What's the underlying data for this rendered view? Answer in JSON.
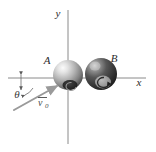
{
  "figure": {
    "kind": "physics-collision-diagram",
    "background_color": "#ffffff",
    "width": 156,
    "height": 152
  },
  "axes": {
    "x_label": "x",
    "y_label": "y",
    "axis_color": "#8a8a8a",
    "origin": {
      "x": 68,
      "y": 78
    },
    "x_axis": {
      "x1": 8,
      "y1": 78,
      "x2": 146,
      "y2": 78
    },
    "y_axis": {
      "x1": 68,
      "y1": 10,
      "x2": 68,
      "y2": 144
    },
    "x_label_pos": {
      "x": 139,
      "y": 86
    },
    "y_label_pos": {
      "x": 58,
      "y": 17
    }
  },
  "bodies": [
    {
      "label": "A",
      "name": "sphere-a",
      "cx": 68,
      "cy": 75,
      "r": 15,
      "shade": "light-gray",
      "base_color": "#b9b9b9",
      "highlight_color": "#f2f2f2",
      "shadow_color": "#4e4e4e",
      "label_pos": {
        "x": 47,
        "y": 64
      }
    },
    {
      "label": "B",
      "name": "sphere-b",
      "cx": 101,
      "cy": 74,
      "r": 16,
      "shade": "dark-gray",
      "base_color": "#5a5a5a",
      "highlight_color": "#d6d6d6",
      "shadow_color": "#242424",
      "label_pos": {
        "x": 114,
        "y": 62
      }
    }
  ],
  "vector": {
    "symbol": "v",
    "subscript": "0",
    "has_overbar": true,
    "name": "initial-velocity-vector",
    "color": "#9a9a9a",
    "tail": {
      "x": 14,
      "y": 110
    },
    "tip": {
      "x": 58,
      "y": 85
    },
    "label_pos": {
      "x": 42,
      "y": 105
    }
  },
  "angle": {
    "symbol": "θ",
    "name": "incidence-angle",
    "label_pos": {
      "x": 17,
      "y": 97
    },
    "vertex": {
      "x": 21,
      "y": 78
    },
    "arc_color": "#6a6a6a"
  }
}
